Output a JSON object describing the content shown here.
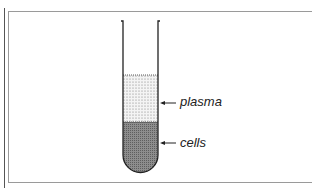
{
  "diagram": {
    "type": "test-tube-blood-separation",
    "layers": [
      {
        "name": "plasma",
        "label": "plasma",
        "fill": "dotted-light"
      },
      {
        "name": "cells",
        "label": "cells",
        "fill": "dense-dark"
      }
    ],
    "colors": {
      "outline": "#222222",
      "plasma_fill": "#f2f2f2",
      "cells_fill": "#8a8a8a",
      "frame": "#9a9a9a"
    }
  }
}
